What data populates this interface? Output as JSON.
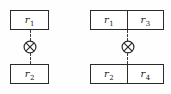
{
  "figure": {
    "background_color": "#fefefe",
    "stroke_color": "#2b2b2b",
    "dash_color": "#3a3a3a"
  },
  "diagrams": [
    {
      "id": "left",
      "name": "single-attribute-join",
      "top_box": {
        "cells": [
          {
            "base": "r",
            "sub": "1"
          }
        ]
      },
      "bottom_box": {
        "cells": [
          {
            "base": "r",
            "sub": "2"
          }
        ]
      },
      "operator": {
        "glyph": "circled-times",
        "label": "⊗"
      }
    },
    {
      "id": "right",
      "name": "two-attribute-join",
      "top_box": {
        "cells": [
          {
            "base": "r",
            "sub": "1"
          },
          {
            "base": "r",
            "sub": "3"
          }
        ]
      },
      "bottom_box": {
        "cells": [
          {
            "base": "r",
            "sub": "2"
          },
          {
            "base": "r",
            "sub": "4"
          }
        ]
      },
      "operator": {
        "glyph": "circled-times",
        "label": "⊗"
      }
    }
  ]
}
